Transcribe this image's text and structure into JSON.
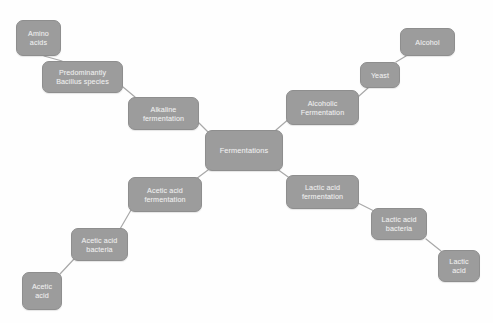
{
  "diagram": {
    "title": "Fermentations",
    "type": "mind-map",
    "colors": {
      "background": "#fefefe",
      "node_fill": "#9c9c9c",
      "node_border": "#8e8e8e",
      "node_text": "#efefef",
      "connector": "#a8a8a8"
    },
    "nodes": [
      {
        "id": "amino-acids",
        "label": "Amino acids",
        "x": 16,
        "y": 20,
        "w": 45,
        "h": 36,
        "font": 7.2
      },
      {
        "id": "bacillus-species",
        "label": "Predominantly Bacillus species",
        "x": 42,
        "y": 61,
        "w": 81,
        "h": 32,
        "font": 7.2
      },
      {
        "id": "alkaline-fermentation",
        "label": "Alkaline fermentation",
        "x": 128,
        "y": 97,
        "w": 71,
        "h": 33,
        "font": 7.2
      },
      {
        "id": "fermentations",
        "label": "Fermentations",
        "x": 205,
        "y": 130,
        "w": 78,
        "h": 41,
        "font": 7.4
      },
      {
        "id": "alcoholic-fermentation",
        "label": "Alcoholic Fermentation",
        "x": 286,
        "y": 90,
        "w": 73,
        "h": 35,
        "font": 7.2
      },
      {
        "id": "yeast",
        "label": "Yeast",
        "x": 360,
        "y": 62,
        "w": 40,
        "h": 26,
        "font": 7.2
      },
      {
        "id": "alcohol",
        "label": "Alcohol",
        "x": 400,
        "y": 28,
        "w": 55,
        "h": 28,
        "font": 7.2
      },
      {
        "id": "lactic-acid-fermentation",
        "label": "Lactic acid fermentation",
        "x": 286,
        "y": 175,
        "w": 73,
        "h": 34,
        "font": 7.2
      },
      {
        "id": "lactic-acid-bacteria",
        "label": "Lactic acid bacteria",
        "x": 371,
        "y": 208,
        "w": 56,
        "h": 32,
        "font": 7.2
      },
      {
        "id": "lactic-acid",
        "label": "Lactic acid",
        "x": 438,
        "y": 250,
        "w": 42,
        "h": 32,
        "font": 7.2
      },
      {
        "id": "acetic-acid-fermentation",
        "label": "Acetic acid fermentation",
        "x": 128,
        "y": 177,
        "w": 74,
        "h": 35,
        "font": 7.2
      },
      {
        "id": "acetic-acid-bacteria",
        "label": "Acetic acid bacteria",
        "x": 71,
        "y": 228,
        "w": 57,
        "h": 33,
        "font": 7.2
      },
      {
        "id": "acetic-acid",
        "label": "Acetic acid",
        "x": 22,
        "y": 272,
        "w": 40,
        "h": 38,
        "font": 7.2
      }
    ],
    "edges": [
      {
        "from": "amino-acids",
        "to": "bacillus-species",
        "x1": 44,
        "y1": 56,
        "x2": 62,
        "y2": 61
      },
      {
        "from": "bacillus-species",
        "to": "alkaline-fermentation",
        "x1": 123,
        "y1": 87,
        "x2": 135,
        "y2": 97
      },
      {
        "from": "alkaline-fermentation",
        "to": "fermentations",
        "x1": 199,
        "y1": 123,
        "x2": 209,
        "y2": 133
      },
      {
        "from": "fermentations",
        "to": "alcoholic-fermentation",
        "x1": 276,
        "y1": 130,
        "x2": 290,
        "y2": 118
      },
      {
        "from": "alcoholic-fermentation",
        "to": "yeast",
        "x1": 359,
        "y1": 96,
        "x2": 368,
        "y2": 88
      },
      {
        "from": "yeast",
        "to": "alcohol",
        "x1": 396,
        "y1": 62,
        "x2": 406,
        "y2": 56
      },
      {
        "from": "fermentations",
        "to": "lactic-acid-fermentation",
        "x1": 277,
        "y1": 169,
        "x2": 291,
        "y2": 179
      },
      {
        "from": "lactic-acid-fermentation",
        "to": "lactic-acid-bacteria",
        "x1": 358,
        "y1": 203,
        "x2": 374,
        "y2": 211
      },
      {
        "from": "lactic-acid-bacteria",
        "to": "lactic-acid",
        "x1": 426,
        "y1": 239,
        "x2": 441,
        "y2": 251
      },
      {
        "from": "fermentations",
        "to": "acetic-acid-fermentation",
        "x1": 208,
        "y1": 170,
        "x2": 196,
        "y2": 179
      },
      {
        "from": "acetic-acid-fermentation",
        "to": "acetic-acid-bacteria",
        "x1": 131,
        "y1": 210,
        "x2": 120,
        "y2": 229
      },
      {
        "from": "acetic-acid-bacteria",
        "to": "acetic-acid",
        "x1": 74,
        "y1": 259,
        "x2": 60,
        "y2": 274
      }
    ]
  }
}
